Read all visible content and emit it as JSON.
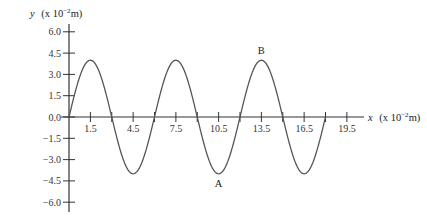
{
  "chart_data": {
    "type": "line",
    "title": "",
    "xlabel": "x (x 10^-2 m)",
    "ylabel": "y (x 10^-2 m)",
    "xlabel_var": "x",
    "xlabel_unit": "(x 10",
    "xlabel_exp": "−2",
    "xlabel_tail": "m)",
    "ylabel_var": "y",
    "ylabel_unit": "(x 10",
    "ylabel_exp": "−2",
    "ylabel_tail": "m)",
    "xlim": [
      0,
      20.9
    ],
    "ylim": [
      -6.0,
      6.0
    ],
    "x_ticks": [
      1.5,
      3,
      4.5,
      6,
      7.5,
      9,
      10.5,
      12,
      13.5,
      15,
      16.5,
      18,
      19.5
    ],
    "x_tick_labels": [
      "1.5",
      "4.5",
      "7.5",
      "10.5",
      "13.5",
      "16.5",
      "19.5"
    ],
    "x_tick_label_values": [
      1.5,
      4.5,
      7.5,
      10.5,
      13.5,
      16.5,
      19.5
    ],
    "y_ticks": [
      6.0,
      4.5,
      3.0,
      1.5,
      0.0,
      -1.5,
      -3.0,
      -4.5,
      -6.0
    ],
    "y_tick_labels": [
      "6.0",
      "4.5",
      "3.0",
      "1.5",
      "0.0",
      "-1.5",
      "-3.0",
      "-4.5",
      "-6.0"
    ],
    "grid": false,
    "legend": null,
    "series": [
      {
        "name": "wave",
        "function": "y = 4.0 sin(2πx/6)",
        "amplitude": 4.0,
        "wavelength": 6.0,
        "x_start": 0,
        "x_end": 18,
        "x": [
          0,
          1.5,
          3,
          4.5,
          6,
          7.5,
          9,
          10.5,
          12,
          13.5,
          15,
          16.5,
          18
        ],
        "values": [
          0,
          4.0,
          0,
          -4.0,
          0,
          4.0,
          0,
          -4.0,
          0,
          4.0,
          0,
          -4.0,
          0
        ]
      }
    ],
    "annotations": [
      {
        "label": "A",
        "x": 10.5,
        "y": -4.0,
        "position": "below"
      },
      {
        "label": "B",
        "x": 13.5,
        "y": 4.0,
        "position": "above"
      }
    ]
  }
}
